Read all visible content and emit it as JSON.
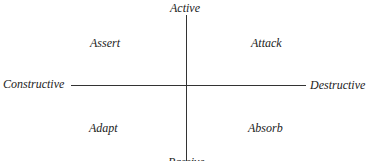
{
  "axes": {
    "top": "Active",
    "bottom": "Passive",
    "left": "Constructive",
    "right": "Destructive"
  },
  "quadrants": {
    "top_left": "Assert",
    "top_right": "Attack",
    "bottom_left": "Adapt",
    "bottom_right": "Absorb"
  }
}
